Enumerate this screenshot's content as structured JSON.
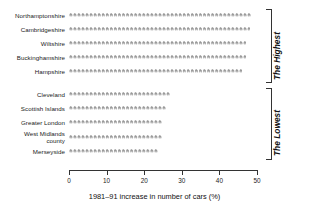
{
  "chart_data": {
    "type": "bar",
    "title": "",
    "subtitle": "",
    "xlabel": "1981–91 increase in number of cars (%)",
    "ylabel": "",
    "xlim": [
      0,
      50
    ],
    "xticks": [
      0,
      10,
      20,
      30,
      40,
      50
    ],
    "xtick_labels": [
      "0",
      "10",
      "20",
      "30",
      "40",
      "50"
    ],
    "grid": false,
    "legend": null,
    "orientation": "horizontal",
    "glyph": "car-pictogram",
    "categories": [
      "Northamptonshire",
      "Cambridgeshire",
      "Wiltshire",
      "Buckinghamshire",
      "Hampshire",
      "Cleveland",
      "Scottish Islands",
      "Greater London",
      "West Midlands county",
      "Merseyside"
    ],
    "values": [
      49,
      48,
      47,
      47,
      46,
      27,
      26,
      25,
      25,
      24
    ],
    "groups": [
      {
        "name": "The Highest",
        "categories": [
          "Northamptonshire",
          "Cambridgeshire",
          "Wiltshire",
          "Buckinghamshire",
          "Hampshire"
        ]
      },
      {
        "name": "The Lowest",
        "categories": [
          "Cleveland",
          "Scottish Islands",
          "Greater London",
          "West Midlands county",
          "Merseyside"
        ]
      }
    ]
  },
  "rows": [
    {
      "label": "Northamptonshire",
      "value": 49
    },
    {
      "label": "Cambridgeshire",
      "value": 48
    },
    {
      "label": "Wiltshire",
      "value": 47
    },
    {
      "label": "Buckinghamshire",
      "value": 47
    },
    {
      "label": "Hampshire",
      "value": 46
    },
    {
      "label": "Cleveland",
      "value": 27
    },
    {
      "label": "Scottish Islands",
      "value": 26
    },
    {
      "label": "Greater London",
      "value": 25
    },
    {
      "label": "West Midlands\ncounty",
      "value": 25
    },
    {
      "label": "Merseyside",
      "value": 24
    }
  ],
  "axis": {
    "ticks": [
      "0",
      "10",
      "20",
      "30",
      "40",
      "50"
    ],
    "title": "1981–91 increase in number of cars (%)"
  },
  "brackets": {
    "highest_label": "The Highest",
    "lowest_label": "The Lowest"
  },
  "colors": {
    "glyph": "#9a9a9a",
    "axis": "#333333",
    "text": "#1a1a1a",
    "background": "#ffffff"
  }
}
